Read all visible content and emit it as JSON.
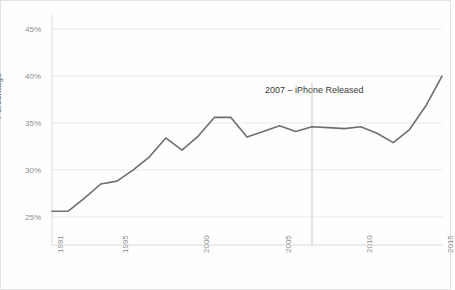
{
  "chart_data": {
    "type": "line",
    "title": "",
    "subtitle": "",
    "xlabel": "",
    "ylabel": "Percentage",
    "xlim": [
      1991,
      2015
    ],
    "ylim": [
      22.0,
      46.5
    ],
    "grid": true,
    "legend_position": "none",
    "y_tick_labels": [
      "45%",
      "40%",
      "35%",
      "30%",
      "25%"
    ],
    "y_tick_values": [
      45,
      40,
      35,
      30,
      25
    ],
    "x_tick_labels": [
      "1991",
      "1995",
      "2000",
      "2005",
      "2010",
      "2015"
    ],
    "x_tick_values": [
      1991,
      1995,
      2000,
      2005,
      2010,
      2015
    ],
    "line_color": "#6e6e6e",
    "grid_color": "#e8e8e8",
    "x": [
      1991,
      1992,
      1993,
      1994,
      1995,
      1996,
      1997,
      1998,
      1999,
      2000,
      2001,
      2002,
      2003,
      2004,
      2005,
      2006,
      2007,
      2008,
      2009,
      2010,
      2011,
      2012,
      2013,
      2014,
      2015
    ],
    "series": [
      {
        "name": "Percentage",
        "values": [
          25.6,
          25.6,
          27.0,
          28.5,
          28.8,
          30.0,
          31.4,
          33.4,
          32.1,
          33.6,
          35.6,
          35.6,
          33.5,
          34.1,
          34.7,
          34.1,
          34.6,
          34.5,
          34.4,
          34.6,
          33.9,
          32.9,
          34.3,
          36.8,
          40.0
        ]
      }
    ],
    "annotations": [
      {
        "label": "2007 – iPhone Released",
        "x": 2007,
        "marker": "vertical-line",
        "text_x": 2004.1,
        "text_y": 38.4
      }
    ]
  }
}
